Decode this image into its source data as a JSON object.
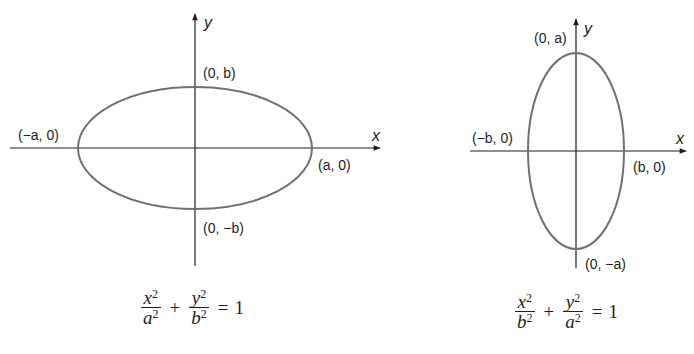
{
  "colors": {
    "axis": "#1e1e1e",
    "ellipse": "#707070",
    "text": "#1e1e1e",
    "background": "#ffffff"
  },
  "diagrams": [
    {
      "name": "horizontal-ellipse",
      "axis_labels": {
        "x": "x",
        "y": "y"
      },
      "points": {
        "top": "(0, b)",
        "bottom": "(0, −b)",
        "left": "(−a, 0)",
        "right": "(a, 0)"
      },
      "equation": {
        "term1_num": "x",
        "term1_den": "a",
        "term2_num": "y",
        "term2_den": "b",
        "exp": "2",
        "plus": "+",
        "equals": "=",
        "rhs": "1"
      }
    },
    {
      "name": "vertical-ellipse",
      "axis_labels": {
        "x": "x",
        "y": "y"
      },
      "points": {
        "top": "(0, a)",
        "bottom": "(0, −a)",
        "left": "(−b, 0)",
        "right": "(b, 0)"
      },
      "equation": {
        "term1_num": "x",
        "term1_den": "b",
        "term2_num": "y",
        "term2_den": "a",
        "exp": "2",
        "plus": "+",
        "equals": "=",
        "rhs": "1"
      }
    }
  ]
}
